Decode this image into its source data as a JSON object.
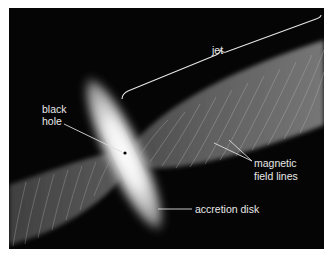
{
  "diagram": {
    "labels": {
      "jet": "jet",
      "black_hole_line1": "black",
      "black_hole_line2": "hole",
      "magnetic_line1": "magnetic",
      "magnetic_line2": "field lines",
      "accretion_disk": "accretion disk"
    },
    "colors": {
      "background": "#050505",
      "label_text": "#e8e8e8",
      "leader_lines": "#dddddd"
    }
  }
}
